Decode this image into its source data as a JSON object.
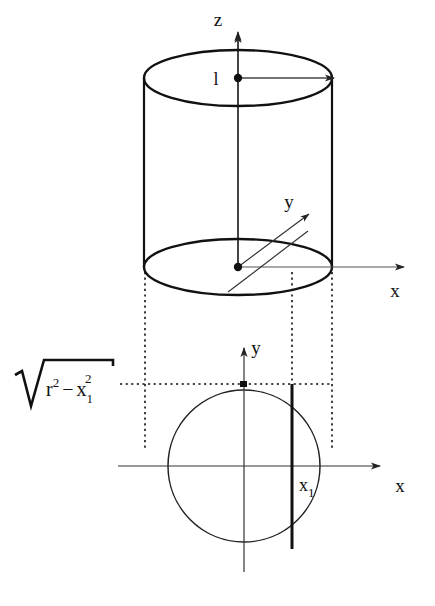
{
  "figure": {
    "background_color": "#ffffff",
    "stroke_color": "#111111",
    "thin_stroke_color": "#333333"
  },
  "solid_3d": {
    "shape": "cylinder",
    "center_top": {
      "x": 238,
      "y": 78
    },
    "center_bottom": {
      "x": 238,
      "y": 267
    },
    "radius_x": 94,
    "radius_y": 28,
    "height_px": 189,
    "axes": [
      {
        "name": "z-axis",
        "label": "z",
        "label_x": 218,
        "label_y": 26,
        "direction": "up"
      },
      {
        "name": "x-axis",
        "label": "x",
        "label_x": 395,
        "label_y": 297,
        "direction": "right"
      },
      {
        "name": "y-axis",
        "label": "y",
        "label_x": 289,
        "label_y": 208,
        "direction": "up-right-diagonal"
      }
    ],
    "radius_arrow": {
      "label": "l",
      "label_x": 216,
      "label_y": 84,
      "from_x": 238,
      "from_y": 78,
      "to_x": 332,
      "to_y": 78
    },
    "origin_dot_top": {
      "x": 238,
      "y": 78
    },
    "origin_dot_bottom": {
      "x": 238,
      "y": 267
    }
  },
  "plane_2d": {
    "shape": "circle",
    "center": {
      "x": 244,
      "y": 466
    },
    "radius": 76,
    "axes": [
      {
        "name": "x-axis",
        "label": "x",
        "label_x": 400,
        "label_y": 492,
        "direction": "right"
      },
      {
        "name": "y-axis",
        "label": "y",
        "label_x": 256,
        "label_y": 352,
        "direction": "up"
      }
    ],
    "chord": {
      "name": "chord-at-x1",
      "x": 292,
      "y_top": 384,
      "y_bottom": 548,
      "label": "x",
      "label_sub": "1",
      "label_x": 300,
      "label_y": 492
    },
    "sqrt_label": {
      "radicand_base_1": "r",
      "radicand_sup_1": "2",
      "operator": "−",
      "radicand_base_2": "x",
      "radicand_sub_2": "1",
      "radicand_sup_2": "2",
      "full_text": "√(r² − x₁²)",
      "x": 14,
      "y": 392
    }
  },
  "projection_lines": [
    {
      "name": "projection-line-left",
      "x": 145,
      "y_top": 272,
      "y_bottom": 448
    },
    {
      "name": "projection-line-middle",
      "x": 292,
      "y_top": 272,
      "y_bottom": 384
    },
    {
      "name": "projection-line-right",
      "x": 332,
      "y_top": 272,
      "y_bottom": 448
    },
    {
      "name": "projection-line-horizontal",
      "y": 384,
      "x_left": 120,
      "x_right": 332
    }
  ]
}
